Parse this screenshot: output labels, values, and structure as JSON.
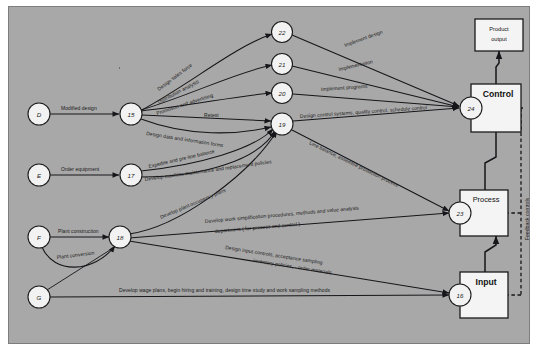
{
  "diagram": {
    "background_color": "#a8a8a8",
    "nodes": [
      {
        "id": "D",
        "label": "D",
        "x": 30,
        "y": 107,
        "type": "source"
      },
      {
        "id": "E",
        "label": "E",
        "x": 30,
        "y": 168,
        "type": "source"
      },
      {
        "id": "F",
        "label": "F",
        "x": 30,
        "y": 230,
        "type": "source"
      },
      {
        "id": "G",
        "label": "G",
        "x": 30,
        "y": 290,
        "type": "source"
      },
      {
        "id": "15",
        "label": "15",
        "x": 122,
        "y": 107,
        "type": "event"
      },
      {
        "id": "17",
        "label": "17",
        "x": 122,
        "y": 168,
        "type": "event"
      },
      {
        "id": "18",
        "label": "18",
        "x": 111,
        "y": 230,
        "type": "event"
      },
      {
        "id": "22",
        "label": "22",
        "x": 273,
        "y": 25,
        "type": "event"
      },
      {
        "id": "21",
        "label": "21",
        "x": 273,
        "y": 57,
        "type": "event"
      },
      {
        "id": "20",
        "label": "20",
        "x": 273,
        "y": 86,
        "type": "event"
      },
      {
        "id": "19",
        "label": "19",
        "x": 273,
        "y": 117,
        "type": "event"
      },
      {
        "id": "24",
        "label": "24",
        "x": 462,
        "y": 101,
        "type": "event"
      },
      {
        "id": "23",
        "label": "23",
        "x": 451,
        "y": 206,
        "type": "event"
      },
      {
        "id": "16",
        "label": "16",
        "x": 451,
        "y": 288,
        "type": "event"
      }
    ],
    "boxes": [
      {
        "name": "product-output",
        "label": "Product output",
        "line1": "Product",
        "line2": "output",
        "x": 466,
        "y": 12,
        "w": 48,
        "h": 32
      },
      {
        "name": "control",
        "label": "Control",
        "x": 462,
        "y": 77,
        "w": 50,
        "h": 48
      },
      {
        "name": "process",
        "label": "Process",
        "x": 451,
        "y": 183,
        "w": 48,
        "h": 46
      },
      {
        "name": "input",
        "label": "Input",
        "x": 451,
        "y": 265,
        "w": 48,
        "h": 46
      }
    ],
    "edge_labels": [
      {
        "id": "modified-design",
        "text": "Modified design"
      },
      {
        "id": "order-equipment",
        "text": "Order equipment"
      },
      {
        "id": "plant-construction",
        "text": "Plant construction"
      },
      {
        "id": "plant-conversion",
        "text": "Plant conversion"
      },
      {
        "id": "design-sales-force",
        "text": "Design sales force"
      },
      {
        "id": "distribution-analysis",
        "text": "Distribution analysis"
      },
      {
        "id": "promotion-and-advertising",
        "text": "Promotion and advertising"
      },
      {
        "id": "retest",
        "text": "Retest"
      },
      {
        "id": "design-data-and-information-forms",
        "text": "Design data and information forms"
      },
      {
        "id": "expedite-and-pre-line-balance",
        "text": "Expedite and pre-line balance"
      },
      {
        "id": "develop-machine-maintenance",
        "text": "Develop machine maintenance and replacement policies"
      },
      {
        "id": "develop-plant-occupancy-plans",
        "text": "Develop plant occupancy plans"
      },
      {
        "id": "develop-work-simplification-1",
        "text": "Develop work simplification procedures, methods and value analysis"
      },
      {
        "id": "develop-work-simplification-2",
        "text": "department ( for process and control )"
      },
      {
        "id": "implement-design",
        "text": "Implement design"
      },
      {
        "id": "implementation",
        "text": "Implementation"
      },
      {
        "id": "implement-programs",
        "text": "Implement programs"
      },
      {
        "id": "design-control-systems",
        "text": "Design control systems, quality control, schedule control"
      },
      {
        "id": "line-balance",
        "text": "Line balance, assemble production process"
      },
      {
        "id": "design-input-controls-1",
        "text": "Design input controls, acceptance sampling"
      },
      {
        "id": "design-input-controls-2",
        "text": "inventory policies, - order materials"
      },
      {
        "id": "develop-wage-plans",
        "text": "Develop wage plans, begin hiring and training, design time study and work sampling methods"
      },
      {
        "id": "feedback-controls",
        "text": "Feedback controls"
      }
    ]
  }
}
